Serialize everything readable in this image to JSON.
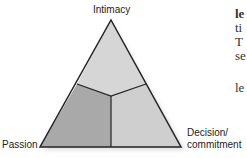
{
  "diagram": {
    "vertices": {
      "top": "Intimacy",
      "bottom_left": "Passion",
      "bottom_right_line1": "Decision/",
      "bottom_right_line2": "commitment"
    },
    "regions": [
      {
        "name": "intimacy-region",
        "color": "#d6d6d6"
      },
      {
        "name": "passion-region",
        "color": "#a9a9a9"
      },
      {
        "name": "commitment-region",
        "color": "#cfcfcf"
      }
    ]
  },
  "side_text": {
    "line1": "le",
    "line2": "ti",
    "line3": "T",
    "line4": "se",
    "line5": "le"
  }
}
